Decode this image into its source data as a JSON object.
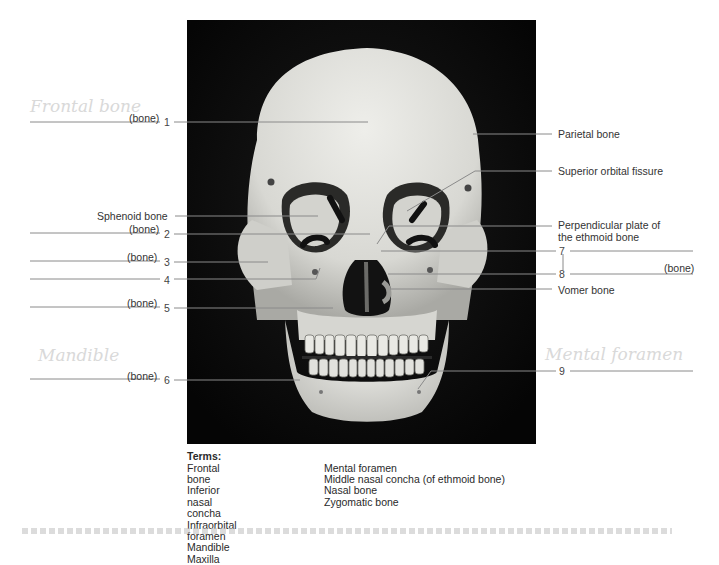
{
  "figure": {
    "photo_subject": "Anterior view of human skull",
    "left_labels": [
      {
        "blank": "(bone)",
        "number": "1"
      },
      {
        "text": "Sphenoid bone"
      },
      {
        "blank": "(bone)",
        "number": "2"
      },
      {
        "blank": "(bone)",
        "number": "3"
      },
      {
        "blank": "",
        "number": "4"
      },
      {
        "blank": "(bone)",
        "number": "5"
      },
      {
        "blank": "(bone)",
        "number": "6"
      }
    ],
    "right_labels": [
      {
        "text": "Parietal bone"
      },
      {
        "text": "Superior orbital fissure"
      },
      {
        "text_line1": "Perpendicular plate of",
        "text_line2": "the ethmoid bone"
      },
      {
        "blank": "",
        "number": "7"
      },
      {
        "blank": "(bone)",
        "number": "8"
      },
      {
        "text": "Vomer bone"
      },
      {
        "blank": "",
        "number": "9"
      }
    ],
    "handwritten_notes": {
      "near_1": "Frontal bone",
      "near_6": "Mandible",
      "near_9": "Mental foramen"
    }
  },
  "terms": {
    "heading": "Terms:",
    "column1": [
      "Frontal bone",
      "Inferior nasal concha",
      "Infraorbital foramen",
      "Mandible",
      "Maxilla"
    ],
    "column2": [
      "Mental foramen",
      "Middle nasal concha (of ethmoid bone)",
      "Nasal bone",
      "Zygomatic bone"
    ]
  },
  "colors": {
    "background": "#ffffff",
    "photo_background": "#070707",
    "bone": "#e6e6e2",
    "leader_line": "#8a8a8a",
    "text": "#2a2a2a",
    "pencil": "#d9d9d9"
  }
}
